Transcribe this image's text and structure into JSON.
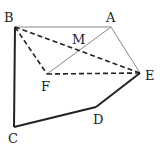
{
  "diagram": {
    "points": {
      "B": {
        "x": 15,
        "y": 27,
        "label": "B",
        "lx": 4,
        "ly": 22
      },
      "A": {
        "x": 111,
        "y": 27,
        "label": "A",
        "lx": 106,
        "ly": 22
      },
      "M": {
        "x": 79,
        "y": 51,
        "label": "M",
        "lx": 72,
        "ly": 44
      },
      "F": {
        "x": 47,
        "y": 74,
        "label": "F",
        "lx": 41,
        "ly": 91
      },
      "E": {
        "x": 140,
        "y": 73,
        "label": "E",
        "lx": 145,
        "ly": 80
      },
      "D": {
        "x": 96,
        "y": 107,
        "label": "D",
        "lx": 93,
        "ly": 124
      },
      "C": {
        "x": 14,
        "y": 127,
        "label": "C",
        "lx": 8,
        "ly": 143
      }
    },
    "segments": [
      {
        "from": "B",
        "to": "A",
        "style": "thin"
      },
      {
        "from": "A",
        "to": "E",
        "style": "thin"
      },
      {
        "from": "A",
        "to": "F",
        "style": "thin"
      },
      {
        "from": "B",
        "to": "E",
        "style": "dashed"
      },
      {
        "from": "B",
        "to": "F",
        "style": "dashed"
      },
      {
        "from": "F",
        "to": "E",
        "style": "dashed"
      },
      {
        "from": "B",
        "to": "C",
        "style": "thick"
      },
      {
        "from": "C",
        "to": "D",
        "style": "thick"
      },
      {
        "from": "D",
        "to": "E",
        "style": "thick"
      }
    ]
  }
}
